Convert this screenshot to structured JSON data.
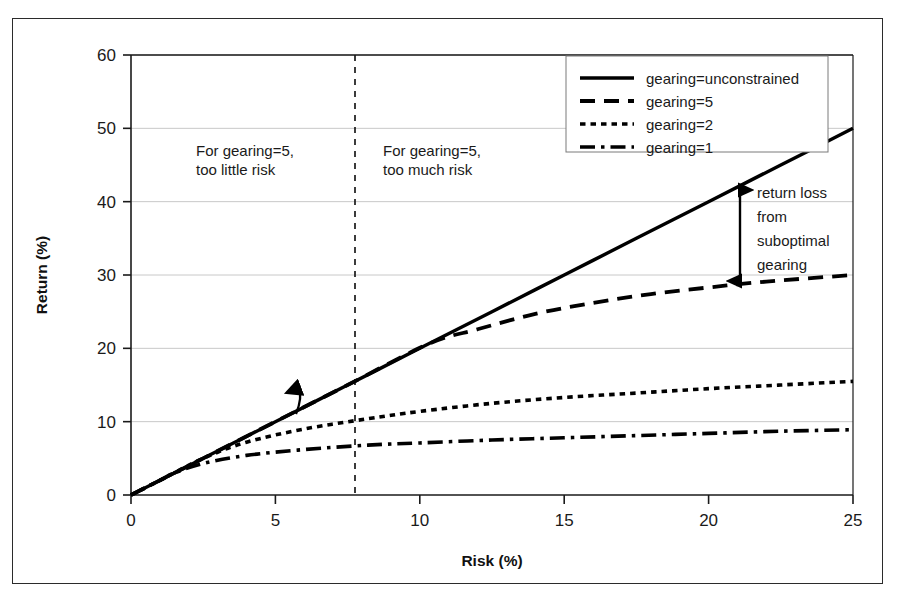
{
  "chart_data": {
    "type": "line",
    "title": "",
    "xlabel": "Risk (%)",
    "ylabel": "Return (%)",
    "xlim": [
      0,
      25
    ],
    "ylim": [
      0,
      60
    ],
    "xticks": [
      0,
      5,
      10,
      15,
      20,
      25
    ],
    "yticks": [
      0,
      10,
      20,
      30,
      40,
      50,
      60
    ],
    "xtick_labels": [
      "0",
      "5",
      "10",
      "15",
      "20",
      "25"
    ],
    "ytick_labels": [
      "0",
      "10",
      "20",
      "30",
      "40",
      "50",
      "60"
    ],
    "grid": "horizontal",
    "legend_position": "top-right",
    "series": [
      {
        "name": "gearing=unconstrained",
        "style": "solid",
        "x": [
          0,
          2.5,
          5,
          7.5,
          10,
          12.5,
          15,
          17.5,
          20,
          22.5,
          25
        ],
        "values": [
          0,
          5,
          10,
          15,
          20,
          25,
          30,
          35,
          40,
          45,
          50
        ]
      },
      {
        "name": "gearing=5",
        "style": "dashed",
        "x": [
          0,
          2.5,
          5,
          7.5,
          10.3,
          12,
          14,
          16,
          18,
          20,
          22,
          25
        ],
        "values": [
          0,
          5,
          10,
          15,
          20.6,
          22.6,
          24.7,
          26.2,
          27.4,
          28.3,
          29.1,
          30
        ]
      },
      {
        "name": "gearing=2",
        "style": "dotted",
        "x": [
          0,
          1,
          2.5,
          4,
          6,
          8.2,
          10,
          12.5,
          15,
          17.5,
          20,
          22.5,
          25
        ],
        "values": [
          0,
          2,
          5,
          7.2,
          9,
          10.4,
          11.4,
          12.5,
          13.3,
          13.9,
          14.5,
          15,
          15.5
        ]
      },
      {
        "name": "gearing=1",
        "style": "dash-dot",
        "x": [
          0,
          1,
          1.5,
          2.5,
          4,
          6,
          8.2,
          10,
          12.5,
          15,
          17.5,
          20,
          22.5,
          25
        ],
        "values": [
          0,
          2,
          3,
          4.3,
          5.4,
          6.2,
          6.8,
          7.1,
          7.5,
          7.8,
          8.1,
          8.4,
          8.7,
          8.9
        ]
      }
    ],
    "annotations": [
      {
        "name": "left-region-note",
        "text_lines": [
          "For gearing=5,",
          "too little risk"
        ],
        "x": 3.2,
        "y": 46
      },
      {
        "name": "right-region-note",
        "text_lines": [
          "For gearing=5,",
          "too much risk"
        ],
        "x": 9.2,
        "y": 46
      },
      {
        "name": "return-loss-note",
        "text_lines": [
          "return loss",
          "from",
          "suboptimal",
          "gearing"
        ],
        "x": 21.8,
        "y": 40
      },
      {
        "name": "divider-line",
        "type": "vertical-dashed",
        "x": 8.2
      },
      {
        "name": "return-loss-arrow",
        "type": "double-arrow",
        "x": 21.1,
        "y_top": 41.5,
        "y_bottom": 29.2
      },
      {
        "name": "curve-pointer-arrow",
        "type": "curved-arrow",
        "x": 6.3,
        "y": 12.8
      }
    ]
  },
  "legend": {
    "entries": [
      {
        "label": "gearing=unconstrained",
        "style": "solid"
      },
      {
        "label": "gearing=5",
        "style": "dashed"
      },
      {
        "label": "gearing=2",
        "style": "dotted"
      },
      {
        "label": "gearing=1",
        "style": "dash-dot"
      }
    ]
  },
  "colors": {
    "line": "#000000",
    "grid": "#c8c8c8",
    "axis": "#1a1a1a",
    "frame": "#2b2b2b",
    "background": "#ffffff"
  }
}
